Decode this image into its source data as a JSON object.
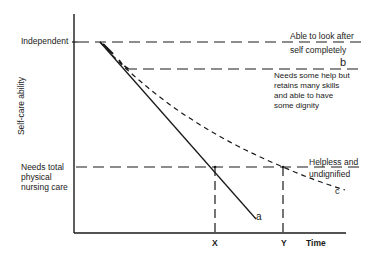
{
  "diagram": {
    "y_axis_label": "Self-care ability",
    "x_axis_label": "Time",
    "y_levels": {
      "top": "Independent",
      "bottom": [
        "Needs total",
        "physical",
        "nursing care"
      ]
    },
    "x_markers": {
      "x": "X",
      "y": "Y"
    },
    "right_annotations": {
      "top": [
        "Able to look after",
        "self completely"
      ],
      "middle": [
        "Needs some help but",
        "retains many skills",
        "and able to have",
        "some dignity"
      ],
      "bottom": [
        "Helpless and",
        "undignified"
      ]
    },
    "curve_labels": {
      "a": "a",
      "b": "b",
      "c": "c"
    }
  }
}
